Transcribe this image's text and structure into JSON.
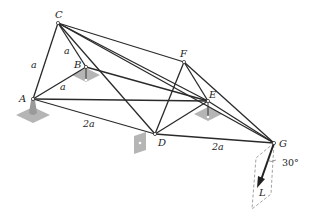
{
  "figure": {
    "type": "space-truss",
    "nodes": [
      {
        "id": "A",
        "label": "A",
        "x": 33,
        "y": 99,
        "support": "ball-socket"
      },
      {
        "id": "B",
        "label": "B",
        "x": 86,
        "y": 67,
        "support": "plate"
      },
      {
        "id": "C",
        "label": "C",
        "x": 58,
        "y": 23,
        "support": null
      },
      {
        "id": "D",
        "label": "D",
        "x": 155,
        "y": 134,
        "support": "wall-plate"
      },
      {
        "id": "E",
        "label": "E",
        "x": 208,
        "y": 101,
        "support": "plate"
      },
      {
        "id": "F",
        "label": "F",
        "x": 184,
        "y": 62,
        "support": null
      },
      {
        "id": "G",
        "label": "G",
        "x": 274,
        "y": 143,
        "support": null
      }
    ],
    "members": [
      [
        "A",
        "C"
      ],
      [
        "A",
        "B"
      ],
      [
        "A",
        "E"
      ],
      [
        "A",
        "D"
      ],
      [
        "C",
        "B"
      ],
      [
        "C",
        "D"
      ],
      [
        "C",
        "F"
      ],
      [
        "C",
        "E"
      ],
      [
        "C",
        "G"
      ],
      [
        "B",
        "E"
      ],
      [
        "F",
        "D"
      ],
      [
        "F",
        "E"
      ],
      [
        "F",
        "G"
      ],
      [
        "D",
        "E"
      ],
      [
        "D",
        "G"
      ],
      [
        "E",
        "G"
      ]
    ],
    "dimensions": [
      {
        "text": "a",
        "member": "A-C"
      },
      {
        "text": "a",
        "member": "C-B"
      },
      {
        "text": "a",
        "member": "A-B"
      },
      {
        "text": "2a",
        "member": "A-D"
      },
      {
        "text": "2a",
        "member": "D-G"
      }
    ],
    "load": {
      "label": "L",
      "at": "G",
      "angle_label": "30°"
    }
  }
}
